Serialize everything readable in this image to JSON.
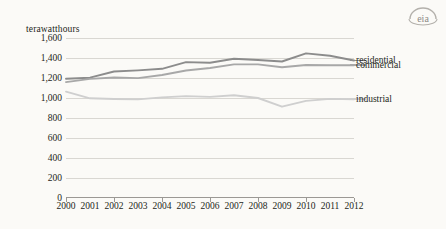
{
  "logo": {
    "name": "eia-logo",
    "text": "eia"
  },
  "chart_data": {
    "type": "line",
    "title": "",
    "subtitle": "",
    "unit_label": "terawatthours",
    "xlabel": "",
    "ylabel": "",
    "grid": true,
    "legend_position": "right",
    "xlim": [
      2000,
      2012
    ],
    "ylim": [
      0,
      1600
    ],
    "ytick_step": 200,
    "x": [
      2000,
      2001,
      2002,
      2003,
      2004,
      2005,
      2006,
      2007,
      2008,
      2009,
      2010,
      2011,
      2012
    ],
    "categories": [
      "2000",
      "2001",
      "2002",
      "2003",
      "2004",
      "2005",
      "2006",
      "2007",
      "2008",
      "2009",
      "2010",
      "2011",
      "2012"
    ],
    "ytick_labels": [
      "1,600",
      "1,400",
      "1,200",
      "1,000",
      "800",
      "600",
      "400",
      "200",
      "0"
    ],
    "ytick_values": [
      1600,
      1400,
      1200,
      1000,
      800,
      600,
      400,
      200,
      0
    ],
    "series": [
      {
        "name": "residential",
        "color": "#8c8c8c",
        "values": [
          1192,
          1203,
          1265,
          1276,
          1292,
          1359,
          1352,
          1392,
          1380,
          1365,
          1446,
          1423,
          1375
        ]
      },
      {
        "name": "commercial",
        "color": "#a8a8a8",
        "values": [
          1159,
          1191,
          1205,
          1199,
          1230,
          1275,
          1300,
          1336,
          1336,
          1307,
          1330,
          1328,
          1327
        ]
      },
      {
        "name": "industrial",
        "color": "#cfcfcf",
        "values": [
          1064,
          997,
          990,
          986,
          1006,
          1019,
          1011,
          1027,
          1000,
          913,
          971,
          991,
          988
        ]
      }
    ]
  },
  "legend": {
    "items": [
      {
        "label": "residential",
        "color": "#8c8c8c"
      },
      {
        "label": "commercial",
        "color": "#a8a8a8"
      },
      {
        "label": "industrial",
        "color": "#cfcfcf"
      }
    ]
  }
}
